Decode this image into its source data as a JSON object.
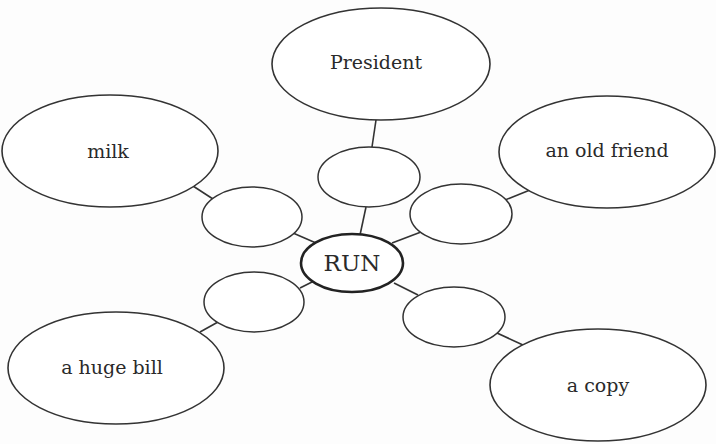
{
  "diagram": {
    "type": "word-web",
    "center": {
      "label": "RUN"
    },
    "branches": [
      {
        "id": "top",
        "label": "President",
        "blank": ""
      },
      {
        "id": "upper-left",
        "label": "milk",
        "blank": ""
      },
      {
        "id": "upper-right",
        "label": "an old friend",
        "blank": ""
      },
      {
        "id": "lower-left",
        "label": "a huge bill",
        "blank": ""
      },
      {
        "id": "lower-right",
        "label": "a copy",
        "blank": ""
      }
    ]
  }
}
